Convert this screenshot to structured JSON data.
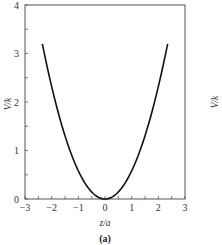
{
  "chart_data": {
    "type": "line",
    "title": "",
    "panel_label": "(a)",
    "xlabel": "z/a",
    "ylabel": "V/k",
    "xlim": [
      -3,
      3
    ],
    "ylim": [
      0,
      4
    ],
    "xticks": [
      "-3",
      "-2",
      "-1",
      "0",
      "1",
      "2",
      "3"
    ],
    "yticks": [
      "0",
      "1",
      "2",
      "3",
      "4"
    ],
    "grid": false,
    "legend": null,
    "series": [
      {
        "name": "V/k",
        "description": "parabolic potential, V/k ≈ 0.58 (z/a)^2",
        "x": [
          -2.35,
          -2.0,
          -1.5,
          -1.0,
          -0.5,
          0.0,
          0.5,
          1.0,
          1.5,
          2.0,
          2.35
        ],
        "y": [
          3.2,
          2.32,
          1.31,
          0.58,
          0.15,
          0.0,
          0.15,
          0.58,
          1.31,
          2.32,
          3.2
        ]
      }
    ],
    "partial_right_panel_label": "V/k"
  }
}
